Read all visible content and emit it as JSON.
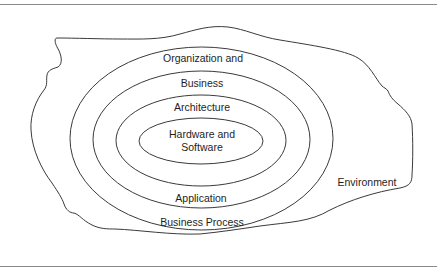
{
  "diagram": {
    "type": "nested-ellipses",
    "layers": [
      {
        "id": "environment",
        "label": "Environment"
      },
      {
        "id": "organization-business",
        "label_lines": [
          "Organization and",
          "Business"
        ]
      },
      {
        "id": "business-process",
        "label": "Business Process"
      },
      {
        "id": "architecture",
        "label": "Architecture"
      },
      {
        "id": "application",
        "label": "Application"
      },
      {
        "id": "hardware-software",
        "label_lines": [
          "Hardware and",
          "Software"
        ]
      }
    ],
    "labels": {
      "organization_and": "Organization and",
      "business": "Business",
      "architecture": "Architecture",
      "hardware_and": "Hardware and",
      "software": "Software",
      "application": "Application",
      "business_process": "Business Process",
      "environment": "Environment"
    },
    "colors": {
      "stroke": "#3a3a3a",
      "text": "#1e1e1e",
      "rule": "#8a8a8a",
      "background": "#ffffff"
    }
  }
}
